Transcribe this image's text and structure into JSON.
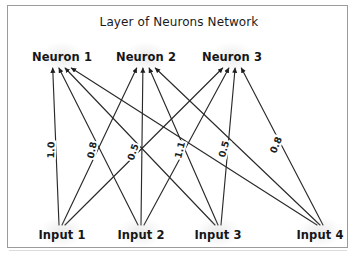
{
  "title": "Layer of Neurons Network",
  "colors": {
    "background": "#ffffff",
    "border": "#9b9b9b",
    "ink": "#161616",
    "edge": "#2a2a2a"
  },
  "chart_data": {
    "type": "diagram",
    "diagram_kind": "neural-network-layer",
    "title": "Layer of Neurons Network",
    "layers": [
      {
        "name": "inputs",
        "role": "input",
        "nodes": [
          {
            "id": "i1",
            "label": "Input 1",
            "x": 62,
            "y": 235
          },
          {
            "id": "i2",
            "label": "Input 2",
            "x": 141,
            "y": 235
          },
          {
            "id": "i3",
            "label": "Input 3",
            "x": 218,
            "y": 235
          },
          {
            "id": "i4",
            "label": "Input 4",
            "x": 320,
            "y": 235
          }
        ]
      },
      {
        "name": "neurons",
        "role": "output",
        "nodes": [
          {
            "id": "n1",
            "label": "Neuron 1",
            "x": 62,
            "y": 57
          },
          {
            "id": "n2",
            "label": "Neuron 2",
            "x": 146,
            "y": 57
          },
          {
            "id": "n3",
            "label": "Neuron 3",
            "x": 232,
            "y": 57
          }
        ]
      }
    ],
    "fully_connected": true,
    "edge_count": 12,
    "edges": [
      {
        "from": "i1",
        "to": "n1",
        "arrow": "to"
      },
      {
        "from": "i1",
        "to": "n2",
        "arrow": "to"
      },
      {
        "from": "i1",
        "to": "n3",
        "arrow": "to"
      },
      {
        "from": "i2",
        "to": "n1",
        "arrow": "to"
      },
      {
        "from": "i2",
        "to": "n2",
        "arrow": "to"
      },
      {
        "from": "i2",
        "to": "n3",
        "arrow": "to"
      },
      {
        "from": "i3",
        "to": "n1",
        "arrow": "to"
      },
      {
        "from": "i3",
        "to": "n2",
        "arrow": "to"
      },
      {
        "from": "i3",
        "to": "n3",
        "arrow": "to"
      },
      {
        "from": "i4",
        "to": "n1",
        "arrow": "to"
      },
      {
        "from": "i4",
        "to": "n2",
        "arrow": "to"
      },
      {
        "from": "i4",
        "to": "n3",
        "arrow": "to"
      }
    ],
    "weight_labels": [
      {
        "id": "w1",
        "text": "1.0",
        "x": 51,
        "y": 150,
        "rotation": -88
      },
      {
        "id": "w2",
        "text": "0.8",
        "x": 92,
        "y": 150,
        "rotation": -78
      },
      {
        "id": "w3",
        "text": "0.5",
        "x": 133,
        "y": 152,
        "rotation": -72
      },
      {
        "id": "w4",
        "text": "1.1",
        "x": 180,
        "y": 150,
        "rotation": -76
      },
      {
        "id": "w5",
        "text": "0.5",
        "x": 224,
        "y": 149,
        "rotation": -74
      },
      {
        "id": "w6",
        "text": "0.8",
        "x": 276,
        "y": 145,
        "rotation": -68
      }
    ]
  }
}
